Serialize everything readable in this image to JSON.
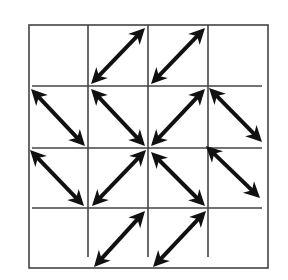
{
  "diagram": {
    "grid": {
      "rows": 4,
      "cols": 4,
      "outer_box": {
        "left": 29,
        "top": 25,
        "right": 268,
        "bottom": 268
      },
      "col_lines_x": [
        88,
        148,
        208
      ],
      "row_lines_y": [
        86,
        148,
        208
      ],
      "line_color": "#444444",
      "line_width": 1.6
    },
    "arrow_style": {
      "color": "#111111",
      "shaft_width": 4,
      "head_length": 16,
      "head_half_width": 8,
      "type": "double-headed"
    },
    "arrows": [
      {
        "row": 0,
        "col": 1,
        "diagonal": "/",
        "x1": 91,
        "y1": 84,
        "x2": 145,
        "y2": 28
      },
      {
        "row": 0,
        "col": 2,
        "diagonal": "/",
        "x1": 151,
        "y1": 84,
        "x2": 205,
        "y2": 28
      },
      {
        "row": 1,
        "col": 0,
        "diagonal": "\\",
        "x1": 31,
        "y1": 89,
        "x2": 85,
        "y2": 146
      },
      {
        "row": 1,
        "col": 1,
        "diagonal": "\\",
        "x1": 91,
        "y1": 89,
        "x2": 145,
        "y2": 146
      },
      {
        "row": 1,
        "col": 2,
        "diagonal": "/",
        "x1": 151,
        "y1": 146,
        "x2": 205,
        "y2": 89
      },
      {
        "row": 1,
        "col": 3,
        "diagonal": "\\",
        "x1": 209,
        "y1": 88,
        "x2": 262,
        "y2": 142
      },
      {
        "row": 2,
        "col": 0,
        "diagonal": "\\",
        "x1": 30,
        "y1": 150,
        "x2": 84,
        "y2": 206
      },
      {
        "row": 2,
        "col": 1,
        "diagonal": "/",
        "x1": 92,
        "y1": 206,
        "x2": 146,
        "y2": 150
      },
      {
        "row": 2,
        "col": 2,
        "diagonal": "\\",
        "x1": 151,
        "y1": 152,
        "x2": 205,
        "y2": 206
      },
      {
        "row": 2,
        "col": 3,
        "diagonal": "\\",
        "x1": 206,
        "y1": 146,
        "x2": 260,
        "y2": 198
      },
      {
        "row": 3,
        "col": 1,
        "diagonal": "/",
        "x1": 94,
        "y1": 267,
        "x2": 145,
        "y2": 211
      },
      {
        "row": 3,
        "col": 2,
        "diagonal": "/",
        "x1": 153,
        "y1": 267,
        "x2": 206,
        "y2": 211
      }
    ]
  }
}
